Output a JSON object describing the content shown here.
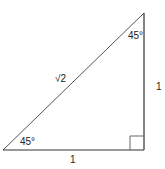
{
  "diagram": {
    "stroke_color": "#333333",
    "vertices": {
      "top": [
        144,
        13
      ],
      "bottom_left": [
        3,
        150
      ],
      "bottom_right": [
        144,
        150
      ]
    },
    "right_angle_marker": {
      "x": 130,
      "y": 136,
      "size": 14
    },
    "labels": {
      "top_angle": "45°",
      "bottom_left_angle": "45°",
      "hypotenuse": "√2",
      "vertical_leg": "1",
      "horizontal_leg": "1"
    }
  }
}
